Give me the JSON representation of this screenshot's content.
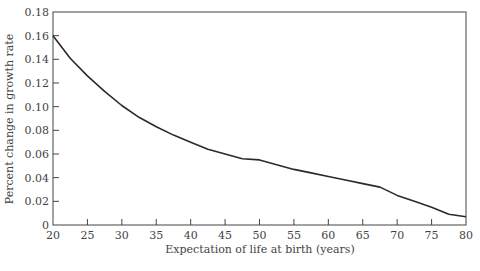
{
  "chart_data": {
    "type": "line",
    "title": "",
    "xlabel": "Expectation of life at birth (years)",
    "ylabel": "Percent change in growth rate",
    "xlim": [
      20,
      80
    ],
    "ylim": [
      0,
      0.18
    ],
    "grid": false,
    "legend": null,
    "x_ticks": [
      "20",
      "25",
      "30",
      "35",
      "40",
      "45",
      "50",
      "55",
      "60",
      "65",
      "70",
      "75",
      "80"
    ],
    "y_ticks": [
      "0",
      "0.02",
      "0.04",
      "0.06",
      "0.08",
      "0.10",
      "0.12",
      "0.14",
      "0.16",
      "0.18"
    ],
    "x": [
      20,
      22.5,
      25,
      27.5,
      30,
      32.5,
      35,
      37.5,
      40,
      42.5,
      45,
      47.5,
      50,
      52.5,
      55,
      57.5,
      60,
      62.5,
      65,
      67.5,
      70,
      72.5,
      75,
      77.5,
      80
    ],
    "series": [
      {
        "name": "Percent change in growth rate",
        "color": "#2a2a2a",
        "values": [
          0.16,
          0.141,
          0.126,
          0.113,
          0.101,
          0.091,
          0.083,
          0.076,
          0.07,
          0.064,
          0.06,
          0.056,
          0.055,
          0.051,
          0.047,
          0.044,
          0.041,
          0.038,
          0.035,
          0.032,
          0.025,
          0.02,
          0.015,
          0.009,
          0.007
        ]
      }
    ]
  }
}
